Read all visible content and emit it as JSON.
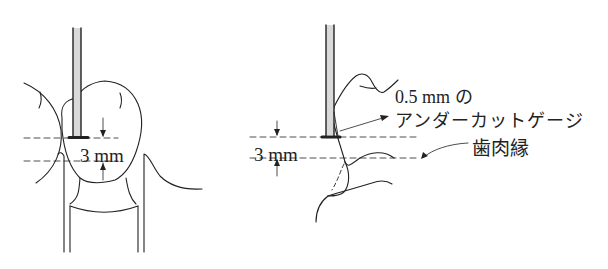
{
  "figure": {
    "left_panel": {
      "measurement_label": "3 mm"
    },
    "right_panel": {
      "measurement_label": "3 mm",
      "gauge_label_line1": "0.5 mm の",
      "gauge_label_line2": "アンダーカットゲージ",
      "gingival_margin_label": "歯肉縁"
    },
    "colors": {
      "line": "#222222",
      "rod_fill": "#d9d9d9",
      "background": "#ffffff"
    }
  }
}
